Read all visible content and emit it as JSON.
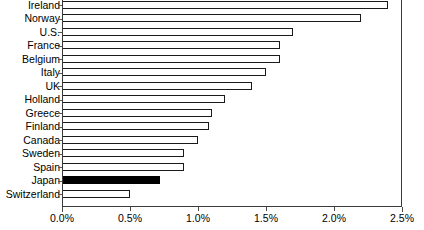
{
  "chart_data": {
    "type": "bar",
    "orientation": "horizontal",
    "title": "",
    "subtitle": "",
    "xlabel": "",
    "ylabel": "",
    "xlim": [
      0,
      2.5
    ],
    "xtick_labels": [
      "0.0%",
      "0.5%",
      "1.0%",
      "1.5%",
      "2.0%",
      "2.5%"
    ],
    "xtick_values": [
      0,
      0.5,
      1.0,
      1.5,
      2.0,
      2.5
    ],
    "grid": false,
    "legend": null,
    "value_unit": "%",
    "categories": [
      "Ireland",
      "Norway",
      "U.S.",
      "France",
      "Belgium",
      "Italy",
      "UK",
      "Holland",
      "Greece",
      "Finland",
      "Canada",
      "Sweden",
      "Spain",
      "Japan",
      "Switzerland"
    ],
    "values": [
      2.4,
      2.2,
      1.7,
      1.6,
      1.6,
      1.5,
      1.4,
      1.2,
      1.1,
      1.08,
      1.0,
      0.9,
      0.9,
      0.72,
      0.5
    ],
    "bars": [
      {
        "label": "Ireland",
        "value": 2.4,
        "highlight": false
      },
      {
        "label": "Norway",
        "value": 2.2,
        "highlight": false
      },
      {
        "label": "U.S.",
        "value": 1.7,
        "highlight": false
      },
      {
        "label": "France",
        "value": 1.6,
        "highlight": false
      },
      {
        "label": "Belgium",
        "value": 1.6,
        "highlight": false
      },
      {
        "label": "Italy",
        "value": 1.5,
        "highlight": false
      },
      {
        "label": "UK",
        "value": 1.4,
        "highlight": false
      },
      {
        "label": "Holland",
        "value": 1.2,
        "highlight": false
      },
      {
        "label": "Greece",
        "value": 1.1,
        "highlight": false
      },
      {
        "label": "Finland",
        "value": 1.08,
        "highlight": false
      },
      {
        "label": "Canada",
        "value": 1.0,
        "highlight": false
      },
      {
        "label": "Sweden",
        "value": 0.9,
        "highlight": false
      },
      {
        "label": "Spain",
        "value": 0.9,
        "highlight": false
      },
      {
        "label": "Japan",
        "value": 0.72,
        "highlight": true
      },
      {
        "label": "Switzerland",
        "value": 0.5,
        "highlight": false
      }
    ],
    "colors": {
      "bar_fill": "#ffffff",
      "bar_outline": "#1a1a1a",
      "highlight_fill": "#000000",
      "axis": "#3a3a3a",
      "text": "#000000",
      "background": "#ffffff"
    }
  }
}
